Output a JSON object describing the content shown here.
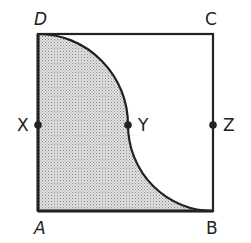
{
  "diagram": {
    "type": "geometry-square-with-shaded-region",
    "colors": {
      "stroke": "#222222",
      "shade": "#b8b8b8",
      "background": "#ffffff"
    },
    "square": {
      "x1": 38,
      "y1": 34,
      "x2": 213,
      "y2": 211
    },
    "labels": {
      "D": "D",
      "C": "C",
      "A": "A",
      "B": "B",
      "X": "X",
      "Y": "Y",
      "Z": "Z"
    },
    "points": [
      {
        "name": "X",
        "x": 38,
        "y": 125
      },
      {
        "name": "Y",
        "x": 128,
        "y": 125
      },
      {
        "name": "Z",
        "x": 213,
        "y": 125
      }
    ],
    "shaded_region": "Region bounded by DA, AB, and the curve from D through Y to B"
  }
}
